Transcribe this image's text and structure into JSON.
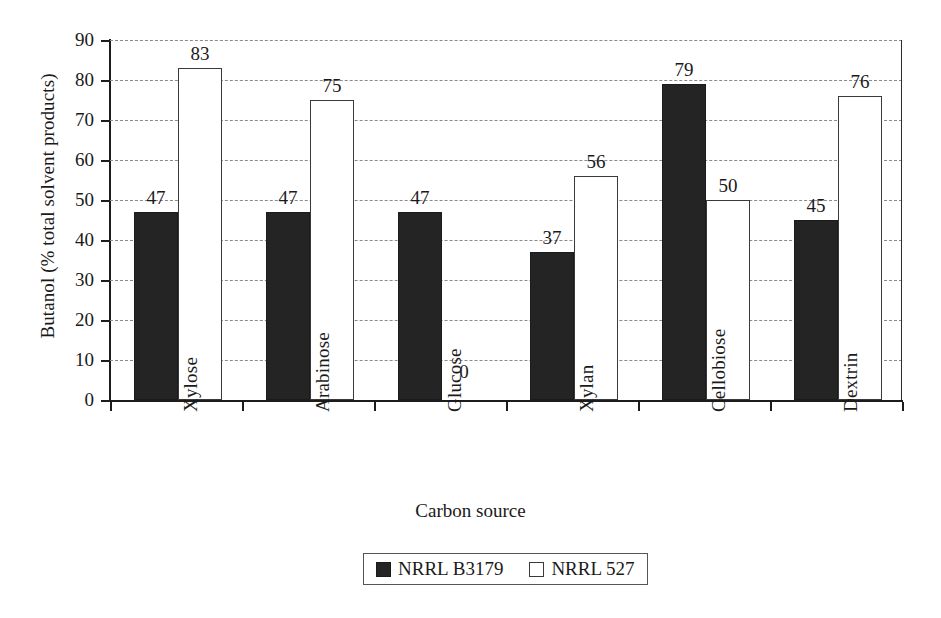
{
  "chart_data": {
    "type": "bar",
    "title": "",
    "xlabel": "Carbon source",
    "ylabel": "Butanol (% total solvent products)",
    "categories": [
      "Xylose",
      "Arabinose",
      "Glucose",
      "Xylan",
      "Cellobiose",
      "Dextrin"
    ],
    "series": [
      {
        "name": "NRRL B3179",
        "color": "#242424",
        "values": [
          47,
          47,
          47,
          37,
          79,
          45
        ]
      },
      {
        "name": "NRRL 527",
        "color": "#ffffff",
        "values": [
          83,
          75,
          0,
          56,
          50,
          76
        ]
      }
    ],
    "ylim": [
      0,
      90
    ],
    "yticks": [
      0,
      10,
      20,
      30,
      40,
      50,
      60,
      70,
      80,
      90
    ],
    "ytick_labels": [
      "0",
      "10",
      "20",
      "30",
      "40",
      "50",
      "60",
      "70",
      "80",
      "90"
    ],
    "grid": true,
    "grid_axis": "y",
    "grid_style": "dashed",
    "legend_position": "bottom-center",
    "data_labels": true,
    "bar_value_labels": [
      [
        "47",
        "83"
      ],
      [
        "47",
        "75"
      ],
      [
        "47",
        "0"
      ],
      [
        "37",
        "56"
      ],
      [
        "79",
        "50"
      ],
      [
        "45",
        "76"
      ]
    ]
  },
  "legend": {
    "entries": [
      {
        "label": "NRRL B3179",
        "swatch": "dark"
      },
      {
        "label": "NRRL 527",
        "swatch": "light"
      }
    ]
  }
}
